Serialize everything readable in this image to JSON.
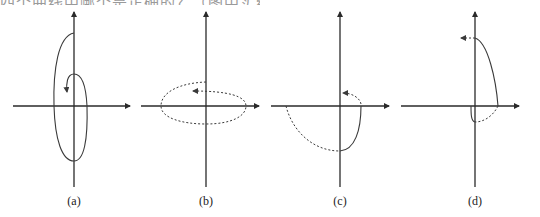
{
  "header": {
    "cut_off_text": "四个曲线中哪个是正确的？（图中实线为……）"
  },
  "colors": {
    "axis": "#2a2a2a",
    "curve": "#3a3a3a",
    "background": "#ffffff"
  },
  "panels": [
    {
      "label": "(a)",
      "origin": [
        74,
        106
      ],
      "description": "solid spiral starting on positive y-axis, going counter-clockwise around origin and curling inward ending with an arrow pointing down"
    },
    {
      "label": "(b)",
      "origin": [
        206,
        106
      ],
      "description": "dotted ellipse around origin, counter-clockwise, ending with left-pointing arrow above x-axis"
    },
    {
      "label": "(c)",
      "origin": [
        340,
        106
      ],
      "description": "dotted arc in third quadrant, solid arc in fourth quadrant, dotted arc to positive y-axis with left arrow"
    },
    {
      "label": "(d)",
      "origin": [
        475,
        106
      ],
      "description": "solid arc from positive y-axis to positive x-axis, dotted arc to negative y-axis, small solid arc, dotted arrow pointing left at top"
    }
  ]
}
